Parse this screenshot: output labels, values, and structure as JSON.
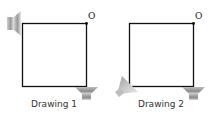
{
  "figure": {
    "drawings": [
      {
        "label": "Drawing 1",
        "origin_label": "O",
        "speakers": [
          {
            "position": "top-left",
            "orientation": "facing-right"
          },
          {
            "position": "bottom-right",
            "orientation": "facing-up"
          }
        ]
      },
      {
        "label": "Drawing 2",
        "origin_label": "O",
        "speakers": [
          {
            "position": "bottom-left",
            "orientation": "facing-up-right"
          },
          {
            "position": "bottom-right",
            "orientation": "facing-up"
          }
        ]
      }
    ],
    "colors": {
      "line": "#111111",
      "speaker_dark": "#7a7a7a",
      "speaker_light": "#d9d9d9"
    }
  }
}
